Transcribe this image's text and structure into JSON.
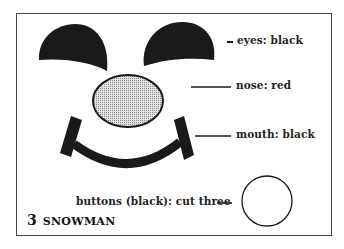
{
  "title": {
    "number": "3",
    "name": "SNOWMAN"
  },
  "labels": {
    "eyes": "eyes: black",
    "nose": "nose: red",
    "mouth": "mouth: black",
    "buttons": "buttons (black): cut three"
  },
  "colors": {
    "ink": "#1a1a1a",
    "nose_fill": "#c8c8c8",
    "frame": "#444444"
  }
}
